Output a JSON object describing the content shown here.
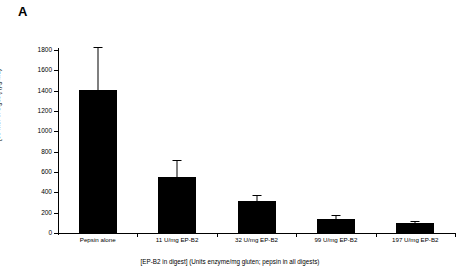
{
  "panel": {
    "letter": "A"
  },
  "chart_data": {
    "type": "bar",
    "title": "",
    "xlabel": "[EP-B2 in digest] (Units enzyme/mg gluten; pepsin in all digests)",
    "ylabel": "[33-mer in digest] (µg/mL)",
    "categories": [
      "Pepsin alone",
      "11 U/mg EP-B2",
      "32 U/mg EP-B2",
      "99 U/mg EP-B2",
      "197 U/mg EP-B2"
    ],
    "values": [
      1410,
      550,
      310,
      140,
      100
    ],
    "error_upper": [
      1830,
      718,
      375,
      175,
      122
    ],
    "error_bars": "upper-only",
    "ylim": [
      0,
      1800
    ],
    "yticks": [
      0,
      200,
      400,
      600,
      800,
      1000,
      1200,
      1400,
      1600,
      1800
    ],
    "ytick_labels": [
      "0",
      "200",
      "400",
      "600",
      "800",
      "1000",
      "1200",
      "1400",
      "1600",
      "1800"
    ],
    "grid": false,
    "legend": false,
    "bar_color": "#000000",
    "axis_color": "#000000",
    "background": "#ffffff"
  }
}
